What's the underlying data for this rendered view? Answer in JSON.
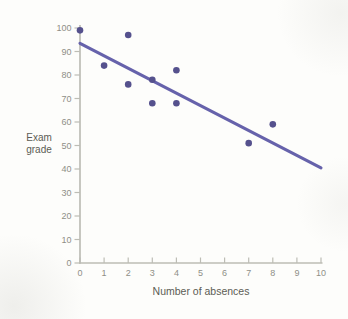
{
  "chart_data": {
    "type": "scatter",
    "title": "",
    "xlabel": "Number of absences",
    "ylabel": "Exam grade",
    "ylabel_display": "Exam\ngrade",
    "xlim": [
      0,
      10
    ],
    "ylim": [
      0,
      100
    ],
    "x_ticks": [
      0,
      1,
      2,
      3,
      4,
      5,
      6,
      7,
      8,
      9,
      10
    ],
    "y_ticks": [
      0,
      10,
      20,
      30,
      40,
      50,
      60,
      70,
      80,
      90,
      100
    ],
    "grid": false,
    "legend_position": "none",
    "points": [
      {
        "x": 0,
        "y": 99
      },
      {
        "x": 1,
        "y": 84
      },
      {
        "x": 2,
        "y": 97
      },
      {
        "x": 2,
        "y": 76
      },
      {
        "x": 3,
        "y": 78
      },
      {
        "x": 3,
        "y": 68
      },
      {
        "x": 4,
        "y": 82
      },
      {
        "x": 4,
        "y": 68
      },
      {
        "x": 7,
        "y": 51
      },
      {
        "x": 8,
        "y": 59
      }
    ],
    "trendline": {
      "x1": 0,
      "y1": 93.5,
      "x2": 10,
      "y2": 40.5
    },
    "colors": {
      "point": "#55518d",
      "trend_line": "#6662ab",
      "axis": "#bdbdb5",
      "tick_label": "#8f8f87",
      "axis_title": "#5c5c54",
      "background": "#fdfdfb"
    }
  }
}
